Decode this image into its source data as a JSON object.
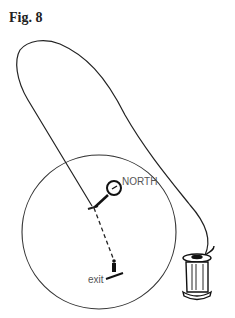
{
  "figure": {
    "title": "Fig. 8",
    "labels": {
      "north": "NORTH",
      "exit": "exit"
    },
    "elements": [
      "thread-loop",
      "labyrinth-circle",
      "compass",
      "person-at-exit",
      "thread-spool"
    ]
  }
}
